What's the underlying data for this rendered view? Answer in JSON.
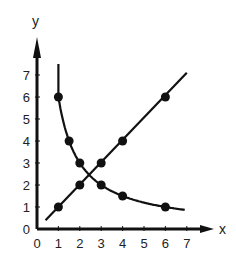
{
  "chart_data": {
    "type": "line",
    "title": "",
    "xlabel": "x",
    "ylabel": "y",
    "xlim": [
      0,
      7
    ],
    "ylim": [
      0,
      7
    ],
    "grid": false,
    "x_ticks": [
      0,
      1,
      2,
      3,
      4,
      5,
      6,
      7
    ],
    "y_ticks": [
      0,
      1,
      2,
      3,
      4,
      5,
      6,
      7
    ],
    "series": [
      {
        "name": "direct proportion (y = x)",
        "points": [
          [
            1,
            1
          ],
          [
            2,
            2
          ],
          [
            3,
            3
          ],
          [
            4,
            4
          ],
          [
            6,
            6
          ]
        ],
        "line_extent": [
          [
            0.4,
            0.4
          ],
          [
            7.0,
            7.1
          ]
        ]
      },
      {
        "name": "inverse proportion (y = 6/x)",
        "points": [
          [
            1,
            6
          ],
          [
            1.5,
            4
          ],
          [
            2,
            3
          ],
          [
            3,
            2
          ],
          [
            4,
            1.5
          ],
          [
            6,
            1
          ]
        ],
        "line_extent": [
          [
            1.0,
            7.5
          ],
          [
            6.9,
            0.87
          ]
        ]
      }
    ]
  },
  "style": {
    "ink_color": "#111111",
    "background": "#ffffff"
  }
}
